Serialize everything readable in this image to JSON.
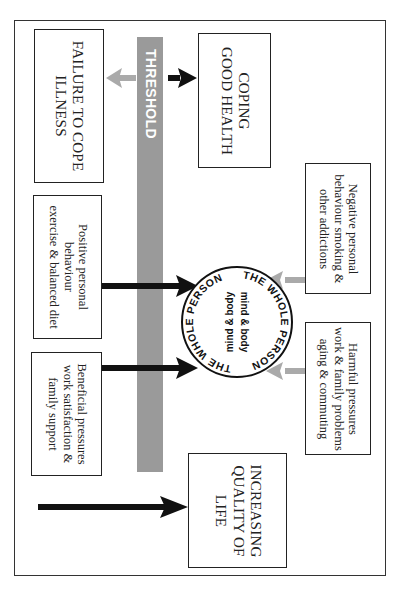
{
  "diagram": {
    "threshold_label": "THRESHOLD",
    "failure_box": {
      "lines": [
        "FAILURE TO COPE",
        "ILLNESS"
      ]
    },
    "coping_box": {
      "lines": [
        "COPING",
        "GOOD HEALTH"
      ]
    },
    "negative_box": {
      "lines": [
        "Negative personal",
        "behaviour smoking &",
        "other addictions"
      ]
    },
    "harmful_box": {
      "lines": [
        "Harmful pressures",
        "work & family problems",
        "aging & commuting"
      ]
    },
    "positive_box": {
      "lines": [
        "Positive personal",
        "behaviour",
        "exercise & balanced diet"
      ]
    },
    "beneficial_box": {
      "lines": [
        "Beneficial pressures",
        "work satisfaction &",
        "family support"
      ]
    },
    "quality_box": {
      "lines": [
        "INCREASING",
        "QUALITY OF",
        "LIFE"
      ]
    },
    "center_circle": {
      "ring_text": "THE WHOLE PERSON",
      "inner_lines": [
        "mind & body",
        "mind & body"
      ]
    },
    "colors": {
      "threshold_bar": "#9a9a9a",
      "negative_arrow": "#aaaaaa",
      "positive_arrow": "#111111",
      "border": "#222222"
    }
  }
}
